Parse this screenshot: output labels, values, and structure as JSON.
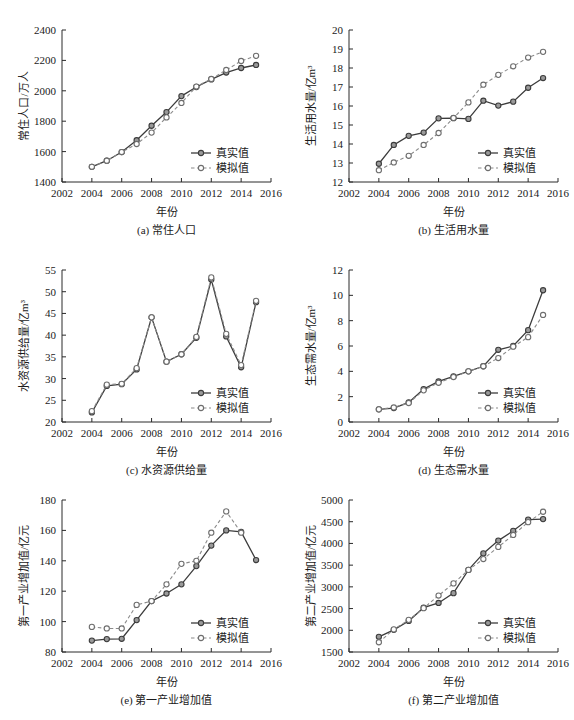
{
  "figure": {
    "xlabel": "年份",
    "legend": {
      "real": "真实值",
      "sim": "模拟值"
    },
    "x_ticks": [
      2002,
      2004,
      2006,
      2008,
      2010,
      2012,
      2014,
      2016
    ],
    "xlim": [
      2002,
      2016
    ]
  },
  "chart_data": [
    {
      "id": "a",
      "type": "line",
      "title": "(a) 常住人口",
      "xlabel": "年份",
      "ylabel": "常住人口/万人",
      "xlim": [
        2002,
        2016
      ],
      "ylim": [
        1400,
        2400
      ],
      "y_ticks": [
        1400,
        1600,
        1800,
        2000,
        2200,
        2400
      ],
      "grid": false,
      "legend_position": "lower-right",
      "x": [
        2004,
        2005,
        2006,
        2007,
        2008,
        2009,
        2010,
        2011,
        2012,
        2013,
        2014,
        2015
      ],
      "series": [
        {
          "name": "真实值",
          "values": [
            1500,
            1540,
            1597,
            1675,
            1770,
            1860,
            1965,
            2025,
            2075,
            2120,
            2150,
            2170
          ]
        },
        {
          "name": "模拟值",
          "values": [
            1500,
            1540,
            1597,
            1650,
            1725,
            1825,
            1920,
            2028,
            2078,
            2137,
            2196,
            2230
          ]
        }
      ]
    },
    {
      "id": "b",
      "type": "line",
      "title": "(b) 生活用水量",
      "xlabel": "年份",
      "ylabel": "生活用水量/亿m³",
      "xlim": [
        2002,
        2016
      ],
      "ylim": [
        12,
        20
      ],
      "y_ticks": [
        12,
        13,
        14,
        15,
        16,
        17,
        18,
        19,
        20
      ],
      "grid": false,
      "legend_position": "lower-right",
      "x": [
        2004,
        2005,
        2006,
        2007,
        2008,
        2009,
        2010,
        2011,
        2012,
        2013,
        2014,
        2015
      ],
      "series": [
        {
          "name": "真实值",
          "values": [
            12.96,
            13.95,
            14.43,
            14.6,
            15.35,
            15.36,
            15.32,
            16.28,
            16.02,
            16.23,
            16.96,
            17.47
          ]
        },
        {
          "name": "模拟值",
          "values": [
            12.62,
            13.03,
            13.38,
            13.95,
            14.58,
            15.37,
            16.19,
            17.12,
            17.64,
            18.09,
            18.55,
            18.85
          ]
        }
      ]
    },
    {
      "id": "c",
      "type": "line",
      "title": "(c) 水资源供给量",
      "xlabel": "年份",
      "ylabel": "水资源供给量/亿m³",
      "xlim": [
        2002,
        2016
      ],
      "ylim": [
        20,
        55
      ],
      "y_ticks": [
        20,
        25,
        30,
        35,
        40,
        45,
        50,
        55
      ],
      "grid": false,
      "legend_position": "lower-right",
      "x": [
        2004,
        2005,
        2006,
        2007,
        2008,
        2009,
        2010,
        2011,
        2012,
        2013,
        2014,
        2015
      ],
      "series": [
        {
          "name": "真实值",
          "values": [
            22.2,
            28.3,
            28.7,
            32.1,
            44.1,
            33.9,
            35.6,
            39.4,
            52.8,
            39.7,
            32.6,
            47.6
          ]
        },
        {
          "name": "模拟值",
          "values": [
            22.5,
            28.6,
            28.8,
            32.4,
            44.1,
            33.9,
            35.6,
            39.6,
            53.3,
            40.3,
            33.1,
            47.9
          ]
        }
      ]
    },
    {
      "id": "d",
      "type": "line",
      "title": "(d) 生态需水量",
      "xlabel": "年份",
      "ylabel": "生态需水量/亿m³",
      "xlim": [
        2002,
        2016
      ],
      "ylim": [
        0,
        12
      ],
      "y_ticks": [
        0,
        2,
        4,
        6,
        8,
        10,
        12
      ],
      "grid": false,
      "legend_position": "lower-right",
      "x": [
        2004,
        2005,
        2006,
        2007,
        2008,
        2009,
        2010,
        2011,
        2012,
        2013,
        2014,
        2015
      ],
      "series": [
        {
          "name": "真实值",
          "values": [
            1.0,
            1.1,
            1.55,
            2.6,
            3.2,
            3.6,
            4.0,
            4.4,
            5.7,
            6.0,
            7.25,
            10.4
          ]
        },
        {
          "name": "模拟值",
          "values": [
            1.0,
            1.15,
            1.5,
            2.5,
            3.1,
            3.55,
            4.0,
            4.4,
            5.05,
            5.95,
            6.7,
            8.45
          ]
        }
      ]
    },
    {
      "id": "e",
      "type": "line",
      "title": "(e) 第一产业增加值",
      "xlabel": "年份",
      "ylabel": "第一产业增加值/亿元",
      "xlim": [
        2002,
        2016
      ],
      "ylim": [
        80,
        180
      ],
      "y_ticks": [
        80,
        100,
        120,
        140,
        160,
        180
      ],
      "grid": false,
      "legend_position": "lower-right",
      "x": [
        2004,
        2005,
        2006,
        2007,
        2008,
        2009,
        2010,
        2011,
        2012,
        2013,
        2014,
        2015
      ],
      "series": [
        {
          "name": "真实值",
          "values": [
            87.5,
            88.5,
            88.7,
            101.0,
            113.5,
            118.5,
            124.5,
            136.5,
            150.0,
            160.0,
            159.0,
            140.5
          ]
        },
        {
          "name": "模拟值",
          "values": [
            96.5,
            95.5,
            95.5,
            111.0,
            113.5,
            124.5,
            138.0,
            140.0,
            158.5,
            172.5,
            158.5,
            null
          ]
        }
      ]
    },
    {
      "id": "f",
      "type": "line",
      "title": "(f) 第二产业增加值",
      "xlabel": "年份",
      "ylabel": "第二产业增加值/亿元",
      "xlim": [
        2002,
        2016
      ],
      "ylim": [
        1500,
        5000
      ],
      "y_ticks": [
        1500,
        2000,
        2500,
        3000,
        3500,
        4000,
        4500,
        5000
      ],
      "grid": false,
      "legend_position": "lower-right",
      "x": [
        2004,
        2005,
        2006,
        2007,
        2008,
        2009,
        2010,
        2011,
        2012,
        2013,
        2014,
        2015
      ],
      "series": [
        {
          "name": "真实值",
          "values": [
            1850,
            2010,
            2215,
            2520,
            2630,
            2855,
            3390,
            3770,
            4065,
            4290,
            4550,
            4560
          ]
        },
        {
          "name": "模拟值",
          "values": [
            1725,
            2020,
            2240,
            2510,
            2800,
            3080,
            3390,
            3640,
            3920,
            4195,
            4490,
            4730
          ]
        }
      ]
    }
  ]
}
